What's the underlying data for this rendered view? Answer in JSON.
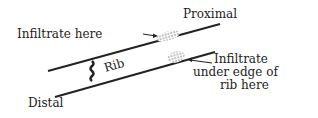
{
  "diagram": {
    "labels": {
      "proximal": "Proximal",
      "distal": "Distal",
      "rib": "Rib",
      "infiltrate_here": "Infiltrate here",
      "infiltrate_under_1": "Infiltrate",
      "infiltrate_under_2": "under edge of",
      "infiltrate_under_3": "rib here"
    },
    "colors": {
      "ink": "#222222",
      "background": "#ffffff"
    }
  }
}
